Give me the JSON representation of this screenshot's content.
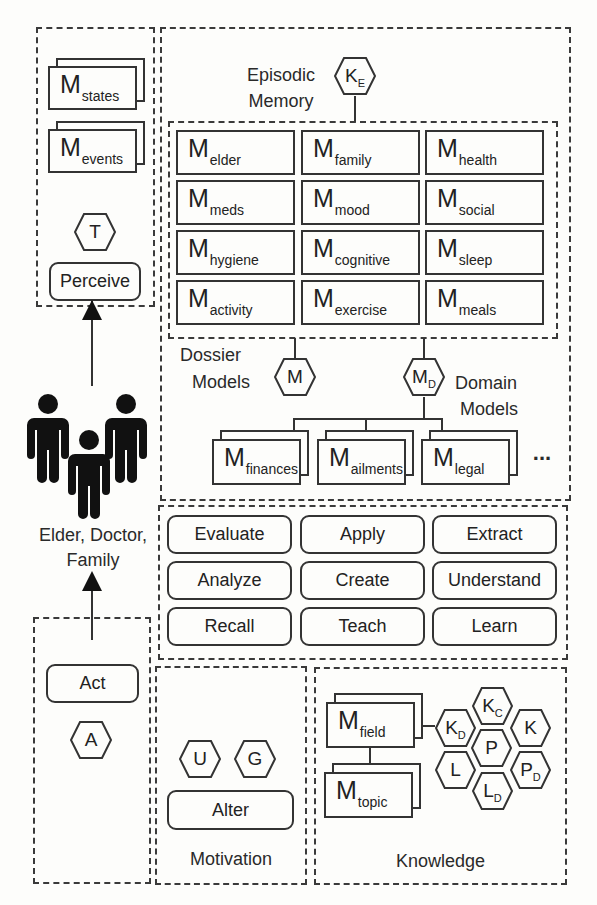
{
  "perceive_panel": {
    "stacks": [
      {
        "base": "M",
        "sub": "states"
      },
      {
        "base": "M",
        "sub": "events"
      }
    ],
    "hex": {
      "base": "T",
      "sub": ""
    },
    "action": "Perceive"
  },
  "actors": {
    "label_line1": "Elder, Doctor,",
    "label_line2": "Family",
    "icon": "people-group-icon"
  },
  "act_panel": {
    "action": "Act",
    "hex": {
      "base": "A",
      "sub": ""
    }
  },
  "memory_panel": {
    "title_line1": "Episodic",
    "title_line2": "Memory",
    "hex": {
      "base": "K",
      "sub": "E"
    },
    "dossier_models": [
      {
        "base": "M",
        "sub": "elder"
      },
      {
        "base": "M",
        "sub": "family"
      },
      {
        "base": "M",
        "sub": "health"
      },
      {
        "base": "M",
        "sub": "meds"
      },
      {
        "base": "M",
        "sub": "mood"
      },
      {
        "base": "M",
        "sub": "social"
      },
      {
        "base": "M",
        "sub": "hygiene"
      },
      {
        "base": "M",
        "sub": "cognitive"
      },
      {
        "base": "M",
        "sub": "sleep"
      },
      {
        "base": "M",
        "sub": "activity"
      },
      {
        "base": "M",
        "sub": "exercise"
      },
      {
        "base": "M",
        "sub": "meals"
      }
    ],
    "dossier_label_line1": "Dossier",
    "dossier_label_line2": "Models",
    "dossier_hex": {
      "base": "M",
      "sub": ""
    },
    "domain_hex": {
      "base": "M",
      "sub": "D"
    },
    "domain_label_line1": "Domain",
    "domain_label_line2": "Models",
    "domain_models": [
      {
        "base": "M",
        "sub": "finances"
      },
      {
        "base": "M",
        "sub": "ailments"
      },
      {
        "base": "M",
        "sub": "legal"
      }
    ],
    "ellipsis": "..."
  },
  "skills_panel": {
    "skills": [
      "Evaluate",
      "Apply",
      "Extract",
      "Analyze",
      "Create",
      "Understand",
      "Recall",
      "Teach",
      "Learn"
    ]
  },
  "motivation_panel": {
    "hexes": [
      {
        "base": "U",
        "sub": ""
      },
      {
        "base": "G",
        "sub": ""
      }
    ],
    "action": "Alter",
    "label": "Motivation"
  },
  "knowledge_panel": {
    "models": [
      {
        "base": "M",
        "sub": "field"
      },
      {
        "base": "M",
        "sub": "topic"
      }
    ],
    "hexes": [
      {
        "base": "K",
        "sub": "C"
      },
      {
        "base": "K",
        "sub": "D"
      },
      {
        "base": "K",
        "sub": ""
      },
      {
        "base": "P",
        "sub": ""
      },
      {
        "base": "L",
        "sub": ""
      },
      {
        "base": "P",
        "sub": "D"
      },
      {
        "base": "L",
        "sub": "D"
      }
    ],
    "label": "Knowledge"
  }
}
